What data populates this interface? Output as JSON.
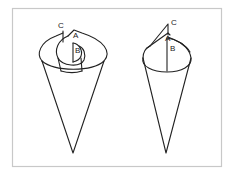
{
  "figure": {
    "colors": {
      "stroke": "#222222",
      "frame": "#c8c8c8",
      "background": "#ffffff"
    },
    "left_cone": {
      "labels": {
        "c": "C",
        "a": "A",
        "b": "B"
      }
    },
    "right_cone": {
      "labels": {
        "c": "C",
        "a": "A",
        "b": "B"
      }
    }
  }
}
